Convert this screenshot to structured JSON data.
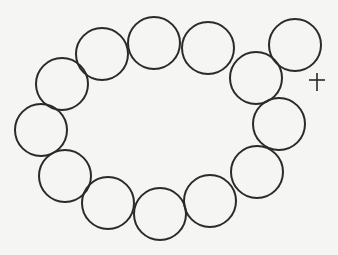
{
  "diagram": {
    "stroke_color": "#2a2a2a",
    "background_color": "#f5f5f3",
    "circle_radius": 26,
    "ring_circles": [
      {
        "cx": 62,
        "cy": 84
      },
      {
        "cx": 102,
        "cy": 54
      },
      {
        "cx": 154,
        "cy": 43
      },
      {
        "cx": 208,
        "cy": 48
      },
      {
        "cx": 256,
        "cy": 78
      },
      {
        "cx": 279,
        "cy": 124
      },
      {
        "cx": 257,
        "cy": 172
      },
      {
        "cx": 210,
        "cy": 201
      },
      {
        "cx": 160,
        "cy": 214
      },
      {
        "cx": 108,
        "cy": 203
      },
      {
        "cx": 65,
        "cy": 176
      },
      {
        "cx": 41,
        "cy": 130
      }
    ],
    "outer_circle": {
      "cx": 295,
      "cy": 45
    },
    "cross_mark": {
      "cx": 317,
      "cy": 82,
      "size": 9
    }
  }
}
